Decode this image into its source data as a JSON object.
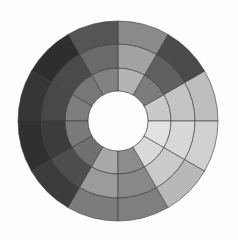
{
  "diagram": {
    "type": "polar-bullseye",
    "background": "#fdfdfd",
    "center": {
      "x": 118,
      "y": 121
    },
    "hole_radius": 30,
    "ring_radii": [
      30,
      53,
      77,
      100
    ],
    "sector_count": 12,
    "sector_angle_deg": 30,
    "start_angle_deg": 0,
    "stroke_color": "#3a3a3a",
    "rings": [
      {
        "name": "inner-ring",
        "colors": [
          "#c9c9c9",
          "#7c7c7c",
          "#b4b4b4",
          "#828282",
          "#777777",
          "#7d7d7d",
          "#7a7a7a",
          "#707070",
          "#a9a9a9",
          "#8c8c8c",
          "#d9d9d9",
          "#e2e2e2"
        ]
      },
      {
        "name": "middle-ring",
        "colors": [
          "#c4c4c4",
          "#606060",
          "#a3a3a3",
          "#6a6a6a",
          "#4a4a4a",
          "#484848",
          "#3c3c3c",
          "#4e4e4e",
          "#9b9b9b",
          "#888888",
          "#cacaca",
          "#d8d8d8"
        ]
      },
      {
        "name": "outer-ring",
        "colors": [
          "#bdbdbd",
          "#4a4a4a",
          "#8a8a8a",
          "#555555",
          "#2e2e2e",
          "#363636",
          "#303030",
          "#3c3c3c",
          "#7c7c7c",
          "#7f7f7f",
          "#b8b8b8",
          "#d0d0d0"
        ]
      }
    ]
  }
}
